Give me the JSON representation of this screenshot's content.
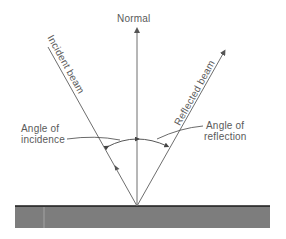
{
  "diagram": {
    "normal_label": "Normal",
    "incident_label": "Incident beam",
    "reflected_label": "Reflected beam",
    "angle_incidence": {
      "line1": "Angle of",
      "line2": "incidence"
    },
    "angle_reflection": {
      "line1": "Angle of",
      "line2": "reflection"
    },
    "colors": {
      "line": "#6e6e6e",
      "surface_fill": "#7d7d7d",
      "surface_edge": "#1a1a1a",
      "text": "#5a5a5a"
    }
  }
}
